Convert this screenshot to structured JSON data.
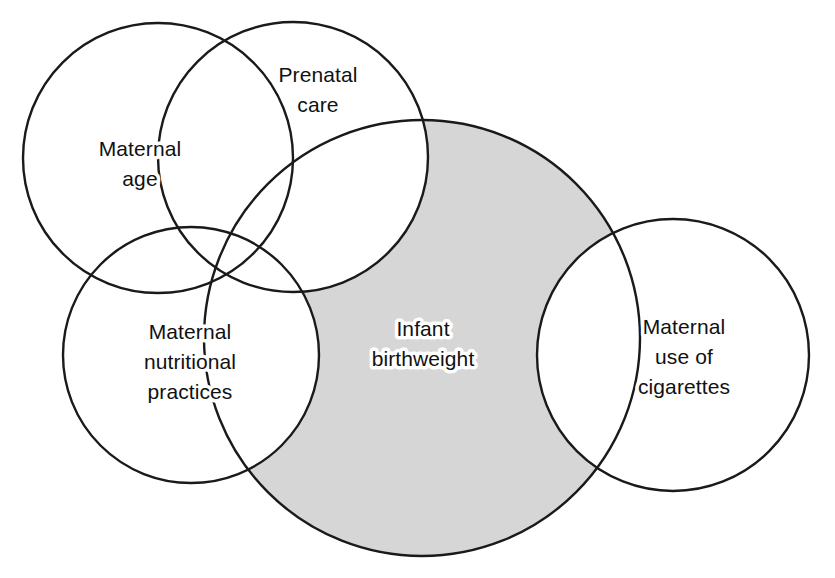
{
  "diagram": {
    "type": "venn",
    "title": "",
    "background_color": "#ffffff",
    "outline_color": "#1a1a1a",
    "shaded_fill_color": "#d6d6d6",
    "label_color": "#111111",
    "sets": [
      {
        "id": "maternal-age",
        "label_lines": [
          "Maternal",
          "age"
        ],
        "line1": "Maternal",
        "line2": "age",
        "line3": "",
        "shaded": false,
        "cx": 158,
        "cy": 158,
        "r": 135,
        "label_x": 140,
        "label_y": 160
      },
      {
        "id": "prenatal-care",
        "label_lines": [
          "Prenatal",
          "care"
        ],
        "line1": "Prenatal",
        "line2": "care",
        "line3": "",
        "shaded": false,
        "cx": 293,
        "cy": 157,
        "r": 135,
        "label_x": 318,
        "label_y": 83
      },
      {
        "id": "maternal-nutritional-practices",
        "label_lines": [
          "Maternal",
          "nutritional",
          "practices"
        ],
        "line1": "Maternal",
        "line2": "nutritional",
        "line3": "practices",
        "shaded": false,
        "cx": 191,
        "cy": 355,
        "r": 128,
        "label_x": 190,
        "label_y": 333
      },
      {
        "id": "infant-birthweight",
        "label_lines": [
          "Infant",
          "birthweight"
        ],
        "line1": "Infant",
        "line2": "birthweight",
        "line3": "",
        "shaded": true,
        "cx": 422,
        "cy": 338,
        "r": 218,
        "label_x": 423,
        "label_y": 338
      },
      {
        "id": "maternal-use-of-cigarettes",
        "label_lines": [
          "Maternal",
          "use of",
          "cigarettes"
        ],
        "line1": "Maternal",
        "line2": "use of",
        "line3": "cigarettes",
        "shaded": false,
        "cx": 673,
        "cy": 355,
        "r": 136,
        "label_x": 684,
        "label_y": 342
      }
    ]
  }
}
